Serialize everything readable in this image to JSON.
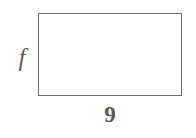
{
  "figure": {
    "kind": "rectangle-diagram",
    "shape": {
      "name": "rectangle",
      "stroke_color": "#6e6e70",
      "fill_color": "#ffffff"
    },
    "labels": {
      "height": {
        "text": "f",
        "style": "italic",
        "position": "left",
        "color": "#5d5d5f"
      },
      "width": {
        "text": "9",
        "style": "bold",
        "position": "bottom",
        "color": "#58585a"
      }
    }
  },
  "background_color": "#ffffff"
}
